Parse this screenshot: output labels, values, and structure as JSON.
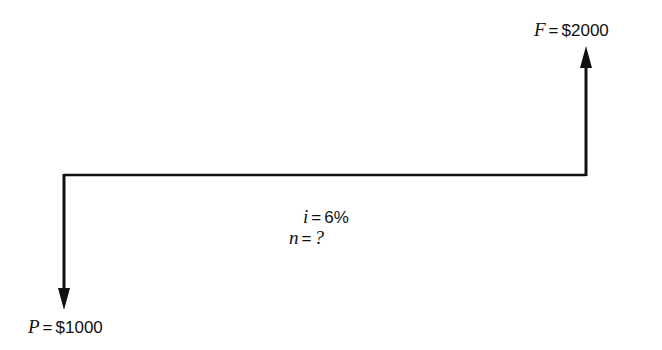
{
  "diagram": {
    "type": "cash-flow-diagram",
    "future_value": {
      "symbol": "F",
      "equals": "=",
      "value": "$2000",
      "direction": "up"
    },
    "present_value": {
      "symbol": "P",
      "equals": "=",
      "value": "$1000",
      "direction": "down"
    },
    "interest_rate": {
      "symbol": "i",
      "equals": "=",
      "value": "6%"
    },
    "periods": {
      "symbol": "n",
      "equals": "=",
      "value": "?"
    },
    "colors": {
      "line": "#111111",
      "background": "#ffffff"
    }
  }
}
